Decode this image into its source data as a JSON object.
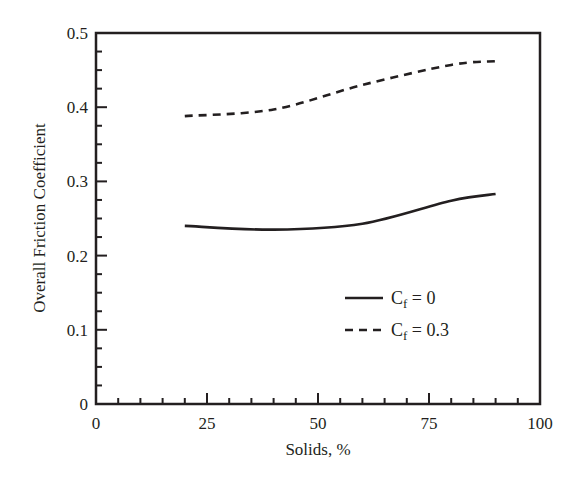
{
  "chart_data": {
    "type": "line",
    "title": "",
    "xlabel": "Solids, %",
    "ylabel": "Overall Friction Coefficient",
    "xlim": [
      0,
      100
    ],
    "ylim": [
      0,
      0.5
    ],
    "x_ticks": [
      0,
      25,
      50,
      75,
      100
    ],
    "x_tick_labels": [
      "0",
      "25",
      "50",
      "75",
      "100"
    ],
    "x_minor_step": 5,
    "y_ticks": [
      0,
      0.1,
      0.2,
      0.3,
      0.4,
      0.5
    ],
    "y_tick_labels": [
      "0",
      "0.1",
      "0.2",
      "0.3",
      "0.4",
      "0.5"
    ],
    "y_minor_step": 0.025,
    "grid": false,
    "legend_position": "lower right (inside plot)",
    "series": [
      {
        "name": "Cf = 0",
        "label_main": "C",
        "label_sub": "f",
        "label_rest": " = 0",
        "style": "solid",
        "color": "#231f20",
        "x": [
          20,
          40,
          60,
          80,
          90
        ],
        "values": [
          0.24,
          0.235,
          0.243,
          0.274,
          0.283
        ]
      },
      {
        "name": "Cf = 0.3",
        "label_main": "C",
        "label_sub": "f",
        "label_rest": " = 0.3",
        "style": "dashed",
        "color": "#231f20",
        "x": [
          20,
          40,
          60,
          80,
          90
        ],
        "values": [
          0.388,
          0.397,
          0.43,
          0.457,
          0.462
        ]
      }
    ]
  }
}
